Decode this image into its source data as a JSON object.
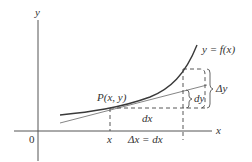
{
  "diagram": {
    "axis_labels": {
      "y": "y",
      "x": "x",
      "origin": "0"
    },
    "curve_label": "y = f(x)",
    "point_label": "P(x, y)",
    "x_tick_label": "x",
    "dx_label": "dx",
    "delta_x_label": "Δx = dx",
    "dy_label": "dy",
    "delta_y_label": "Δy"
  }
}
